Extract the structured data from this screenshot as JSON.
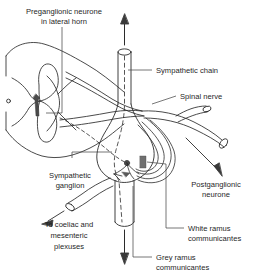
{
  "figure": {
    "background_color": "#ffffff",
    "ink_color": "#2b2b2b",
    "label_color": "#1f1f1f"
  },
  "labels": {
    "preganglionic": {
      "line1": "Preganglionic neurone",
      "line2": "in lateral horn"
    },
    "sympathetic_chain": "Sympathetic chain",
    "spinal_nerve": "Spinal nerve",
    "sympathetic_ganglion": {
      "line1": "Sympathetic",
      "line2": "ganglion"
    },
    "postganglionic": {
      "line1": "Postganglionic",
      "line2": "neurone"
    },
    "coeliac": {
      "line1": "To coeliac and",
      "line2": "mesenteric",
      "line3": "plexuses"
    },
    "white_ramus": {
      "line1": "White ramus",
      "line2": "communicantes"
    },
    "grey_ramus": {
      "line1": "Grey ramus",
      "line2": "communicantes"
    }
  }
}
